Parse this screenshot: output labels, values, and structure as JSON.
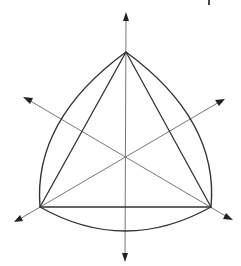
{
  "diagram": {
    "colors": {
      "edge": "#333333",
      "axis": "#777777",
      "background": "#ffffff"
    },
    "vertices": {
      "top": [
        126,
        52
      ],
      "bottom_left": [
        40,
        207
      ],
      "bottom_right": [
        211,
        207
      ]
    },
    "center": [
      125,
      156
    ],
    "axes": [
      {
        "name": "vertical-axis",
        "from": [
          125,
          262
        ],
        "to": [
          126,
          12
        ],
        "arrows": [
          "up",
          "down"
        ]
      },
      {
        "name": "axis-bottom-left-to-upper-right",
        "from": [
          14,
          222
        ],
        "to": [
          225,
          99
        ],
        "arrows": [
          "lower-left",
          "upper-right"
        ]
      },
      {
        "name": "axis-bottom-right-to-upper-left",
        "from": [
          233,
          220
        ],
        "to": [
          23,
          97
        ],
        "arrows": [
          "lower-right",
          "upper-left"
        ]
      }
    ],
    "arcs": [
      "top-to-bottom-left",
      "bottom-left-to-bottom-right",
      "bottom-right-to-top"
    ]
  }
}
